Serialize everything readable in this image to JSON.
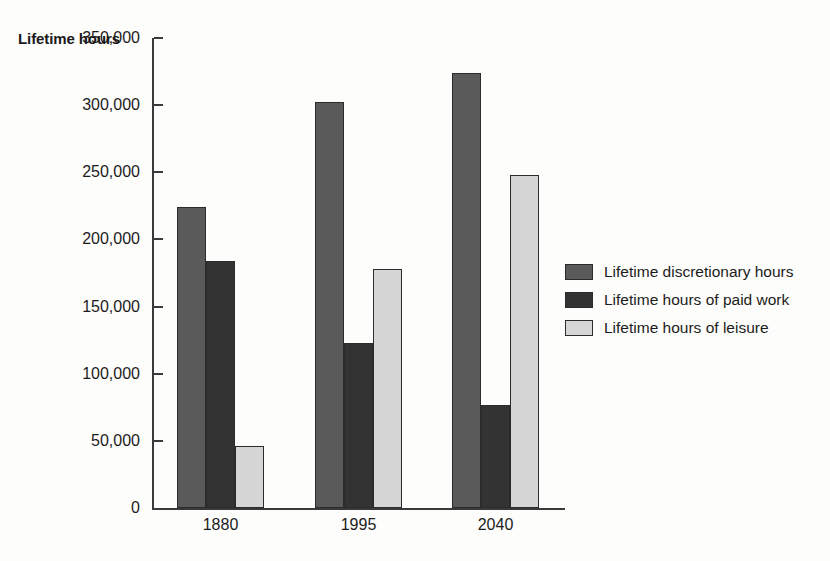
{
  "chart_data": {
    "type": "bar",
    "title": "",
    "ylabel": "Lifetime hours",
    "xlabel": "",
    "categories": [
      "1880",
      "1995",
      "2040"
    ],
    "series": [
      {
        "name": "Lifetime discretionary hours",
        "color": "#5a5a5a",
        "values": [
          224000,
          302000,
          324000
        ]
      },
      {
        "name": "Lifetime hours of paid work",
        "color": "#333333",
        "values": [
          184000,
          123000,
          77000
        ]
      },
      {
        "name": "Lifetime hours of leisure",
        "color": "#d6d6d6",
        "values": [
          46000,
          178000,
          248000
        ]
      }
    ],
    "ylim": [
      0,
      350000
    ],
    "y_ticks": [
      0,
      50000,
      100000,
      150000,
      200000,
      250000,
      300000,
      350000
    ],
    "y_tick_labels": [
      "0",
      "50,000",
      "100,000",
      "150,000",
      "200,000",
      "250,000",
      "300,000",
      "350,000"
    ],
    "grid": false,
    "legend_position": "right"
  },
  "legend": {
    "items": [
      {
        "label": "Lifetime discretionary hours",
        "color": "#5a5a5a"
      },
      {
        "label": "Lifetime hours of paid work",
        "color": "#333333"
      },
      {
        "label": "Lifetime hours of leisure",
        "color": "#d6d6d6"
      }
    ]
  }
}
